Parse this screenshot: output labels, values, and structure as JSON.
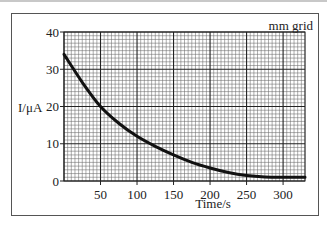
{
  "annotation": "mm grid",
  "chart_data": {
    "type": "line",
    "title": "",
    "xlabel": "Time/s",
    "ylabel": "I/μA",
    "xlim": [
      0,
      330
    ],
    "ylim": [
      0,
      40
    ],
    "xticks": [
      50,
      100,
      150,
      200,
      250,
      300
    ],
    "yticks": [
      0,
      10,
      20,
      30,
      40
    ],
    "grid": true,
    "grid_note": "mm grid",
    "series": [
      {
        "name": "I",
        "x": [
          0,
          25,
          50,
          75,
          100,
          125,
          150,
          175,
          200,
          225,
          250,
          275,
          300,
          330
        ],
        "values": [
          34,
          26.5,
          20,
          15.5,
          12,
          9.3,
          7,
          5,
          3.5,
          2.3,
          1.5,
          1.1,
          1,
          1
        ]
      }
    ]
  },
  "axes": {
    "xlabel": "Time/s",
    "ylabel": "I/μA",
    "xtick_labels": [
      "50",
      "100",
      "150",
      "200",
      "250",
      "300"
    ],
    "ytick_labels": [
      "0",
      "10",
      "20",
      "30",
      "40"
    ]
  }
}
